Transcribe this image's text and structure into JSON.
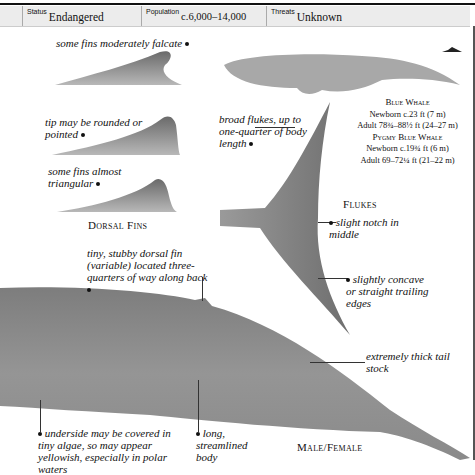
{
  "info_bar": {
    "status": {
      "label": "Status",
      "value": "Endangered"
    },
    "population": {
      "label": "Population",
      "value": "c.6,000–14,000"
    },
    "threats": {
      "label": "Threats",
      "value": "Unknown"
    }
  },
  "dorsal_fins": {
    "caption": "Dorsal Fins",
    "labels": [
      "some fins moderately falcate",
      "tip may be rounded or pointed",
      "some fins almost triangular"
    ]
  },
  "flukes": {
    "caption": "Flukes",
    "labels": {
      "broad": "broad flukes, up to one-quarter of body length",
      "notch": "slight notch in middle",
      "edges": "slightly concave or straight trailing edges"
    }
  },
  "size_box": {
    "blue_whale": {
      "title": "Blue Whale",
      "newborn": "Newborn c.23 ft (7 m)",
      "adult": "Adult 78¾–88½ ft (24–27 m)"
    },
    "pygmy_blue_whale": {
      "title": "Pygmy Blue Whale",
      "newborn": "Newborn c.19¾ ft (6 m)",
      "adult": "Adult 69–72¼ ft (21–22 m)"
    }
  },
  "body": {
    "caption": "Male/Female",
    "labels": {
      "dorsal": "tiny, stubby dorsal fin (variable) located three-quarters of way along back",
      "tail_stock": "extremely thick tail stock",
      "underside": "underside may be covered in tiny algae, so may appear yellowish, especially in polar waters",
      "streamlined": "long, streamlined body"
    }
  },
  "icons": {
    "diver_scale": "diver-scale-icon"
  },
  "colors": {
    "infobar_bg": "#ececec",
    "whale_gray": "#8a8a8a",
    "silhouette": "#a8a8a8"
  }
}
